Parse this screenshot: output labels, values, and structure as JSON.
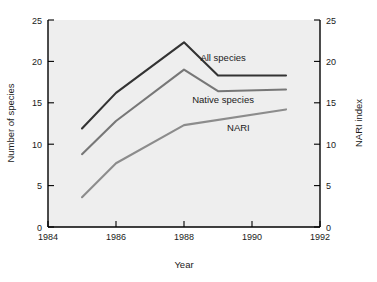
{
  "chart_data": {
    "type": "line",
    "title": "",
    "xlabel": "Year",
    "ylabel": "Number of species",
    "y2label": "NARI index",
    "xlim": [
      1984,
      1992
    ],
    "ylim": [
      0,
      25
    ],
    "y2lim": [
      0,
      25
    ],
    "grid": false,
    "legend_position": "inline-right",
    "xticks": [
      "1984",
      "1986",
      "1988",
      "1990",
      "1992"
    ],
    "xtick_values": [
      1984,
      1986,
      1988,
      1990,
      1992
    ],
    "yticks": [
      "0",
      "5",
      "10",
      "15",
      "20",
      "25"
    ],
    "ytick_values": [
      0,
      5,
      10,
      15,
      20,
      25
    ],
    "y2ticks": [
      "0",
      "5",
      "10",
      "15",
      "20",
      "25"
    ],
    "y2tick_values": [
      0,
      5,
      10,
      15,
      20,
      25
    ],
    "x": [
      1985,
      1986,
      1988,
      1989,
      1991
    ],
    "series": [
      {
        "name": "All species",
        "axis": "left",
        "color": "#333333",
        "x": [
          1985,
          1986,
          1988,
          1989,
          1991
        ],
        "values": [
          11.9,
          16.2,
          22.3,
          18.3,
          18.3
        ]
      },
      {
        "name": "Native species",
        "axis": "left",
        "color": "#777777",
        "x": [
          1985,
          1986,
          1988,
          1989,
          1991
        ],
        "values": [
          8.8,
          12.8,
          19.0,
          16.4,
          16.6
        ]
      },
      {
        "name": "NARI",
        "axis": "right",
        "color": "#8c8c8c",
        "x": [
          1985,
          1986,
          1988,
          1991
        ],
        "values": [
          3.6,
          7.7,
          12.3,
          14.2
        ]
      }
    ],
    "annotations": [
      {
        "text": "All species",
        "x": 1989.15,
        "y": 20.0
      },
      {
        "text": "Native species",
        "x": 1989.15,
        "y": 15.0
      },
      {
        "text": "NARI",
        "x": 1989.6,
        "y": 11.6
      }
    ]
  },
  "colors": {
    "plot_background": "#eeeeee",
    "axis": "#000000",
    "text": "#1a1a1a",
    "all_species": "#333333",
    "native_species": "#777777",
    "nari": "#8c8c8c"
  }
}
